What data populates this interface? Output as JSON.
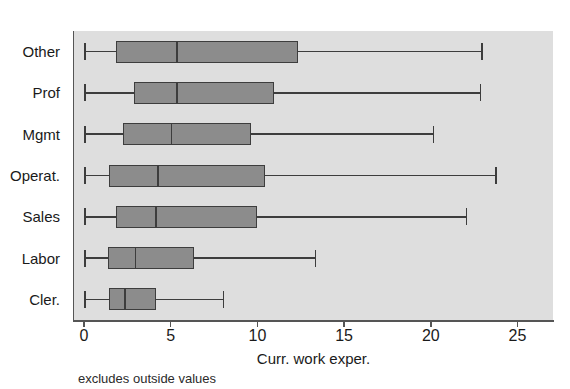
{
  "chart_data": {
    "type": "box",
    "title": "",
    "xlabel": "Curr. work exper.",
    "ylabel": "",
    "footnote": "excludes outside values",
    "orientation": "horizontal",
    "xlim": [
      0,
      26
    ],
    "xticks": [
      0,
      5,
      10,
      15,
      20,
      25
    ],
    "xtick_labels": [
      "0",
      "5",
      "10",
      "15",
      "20",
      "25"
    ],
    "grid": false,
    "legend": null,
    "panel_background": "#dedede",
    "box_fill": "#8c8c8c",
    "box_line": "#3d3d3d",
    "categories": [
      "Other",
      "Prof",
      "Mgmt",
      "Operat.",
      "Sales",
      "Labor",
      "Cler."
    ],
    "boxes": [
      {
        "category": "Other",
        "whisker_low": 0.0,
        "q1": 1.8,
        "median": 5.3,
        "q3": 12.3,
        "whisker_high": 22.9
      },
      {
        "category": "Prof",
        "whisker_low": 0.0,
        "q1": 2.8,
        "median": 5.3,
        "q3": 10.9,
        "whisker_high": 22.8
      },
      {
        "category": "Mgmt",
        "whisker_low": 0.0,
        "q1": 2.2,
        "median": 5.0,
        "q3": 9.6,
        "whisker_high": 20.1
      },
      {
        "category": "Operat.",
        "whisker_low": 0.0,
        "q1": 1.4,
        "median": 4.2,
        "q3": 10.4,
        "whisker_high": 23.7
      },
      {
        "category": "Sales",
        "whisker_low": 0.0,
        "q1": 1.8,
        "median": 4.1,
        "q3": 9.9,
        "whisker_high": 22.0
      },
      {
        "category": "Labor",
        "whisker_low": 0.0,
        "q1": 1.3,
        "median": 2.9,
        "q3": 6.3,
        "whisker_high": 13.3
      },
      {
        "category": "Cler.",
        "whisker_low": 0.0,
        "q1": 1.4,
        "median": 2.3,
        "q3": 4.1,
        "whisker_high": 8.0
      }
    ]
  },
  "axis": {
    "x_title": "Curr. work exper.",
    "tick_labels": [
      "0",
      "5",
      "10",
      "15",
      "20",
      "25"
    ]
  },
  "note": {
    "text": "excludes outside values"
  }
}
